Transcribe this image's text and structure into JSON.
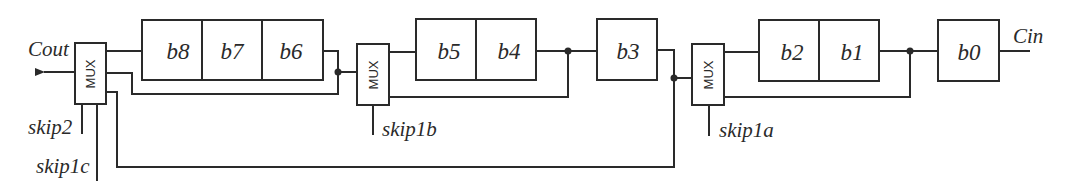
{
  "diagram": {
    "type": "carry-skip adder block diagram",
    "signals": {
      "carry_out": "Cout",
      "carry_in": "Cin"
    },
    "mux_label": "MUX",
    "muxes": [
      {
        "id": "mux-c",
        "label": "MUX",
        "selects": [
          "skip2",
          "skip1c"
        ]
      },
      {
        "id": "mux-b",
        "label": "MUX",
        "selects": [
          "skip1b"
        ]
      },
      {
        "id": "mux-a",
        "label": "MUX",
        "selects": [
          "skip1a"
        ]
      }
    ],
    "select_labels": {
      "skip2": "skip2",
      "skip1c": "skip1c",
      "skip1b": "skip1b",
      "skip1a": "skip1a"
    },
    "bit_groups": [
      {
        "id": "group-876",
        "bits": [
          "b8",
          "b7",
          "b6"
        ]
      },
      {
        "id": "group-54",
        "bits": [
          "b5",
          "b4"
        ]
      },
      {
        "id": "group-3",
        "bits": [
          "b3"
        ]
      },
      {
        "id": "group-21",
        "bits": [
          "b2",
          "b1"
        ]
      },
      {
        "id": "group-0",
        "bits": [
          "b0"
        ]
      }
    ],
    "bits": {
      "b8": "b8",
      "b7": "b7",
      "b6": "b6",
      "b5": "b5",
      "b4": "b4",
      "b3": "b3",
      "b2": "b2",
      "b1": "b1",
      "b0": "b0"
    },
    "colors": {
      "line": "#2a2a2a",
      "background": "#ffffff"
    }
  }
}
